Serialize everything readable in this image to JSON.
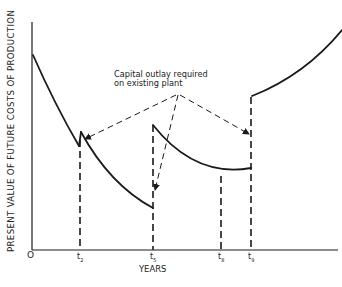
{
  "diagram": {
    "y_axis_label": "PRESENT VALUE OF FUTURE COSTS OF PRODUCTION",
    "x_axis_label": "YEARS",
    "origin_label": "O",
    "ticks": [
      {
        "base": "t",
        "sub": "2"
      },
      {
        "base": "t",
        "sub": "5"
      },
      {
        "base": "t",
        "sub": "8"
      },
      {
        "base": "t",
        "sub": "9"
      }
    ],
    "annotation": {
      "line1": "Capital outlay required",
      "line2": "on existing plant"
    },
    "line_color": "#1a1a1a"
  }
}
